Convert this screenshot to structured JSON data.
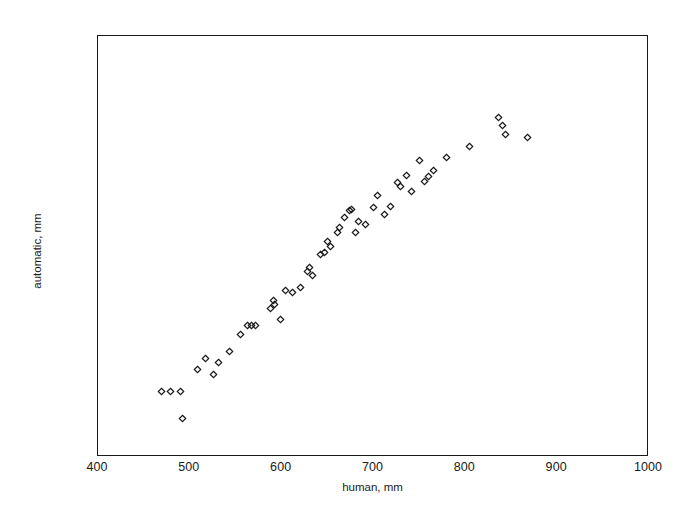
{
  "chart_data": {
    "type": "scatter",
    "title": "",
    "xlabel": "human, mm",
    "ylabel": "automatic, mm",
    "xlim": [
      400,
      1000
    ],
    "ylim": [
      400,
      1000
    ],
    "xticks": [
      400,
      500,
      600,
      700,
      800,
      900,
      1000
    ],
    "yticks": [
      400,
      500,
      600,
      700,
      800,
      900,
      1000
    ],
    "xtick_labels": [
      "400",
      "500",
      "600",
      "700",
      "800",
      "900",
      "1000"
    ],
    "ytick_labels": [
      "400",
      "500",
      "600",
      "700",
      "800",
      "900",
      "1000"
    ],
    "grid": false,
    "legend": null,
    "marker": "diamond-open",
    "marker_color": "#1a1a1a",
    "series": [
      {
        "name": "measurements",
        "points": [
          [
            469,
            494
          ],
          [
            479,
            494
          ],
          [
            490,
            493
          ],
          [
            492,
            455
          ],
          [
            508,
            524
          ],
          [
            517,
            540
          ],
          [
            526,
            518
          ],
          [
            531,
            534
          ],
          [
            543,
            551
          ],
          [
            555,
            575
          ],
          [
            563,
            588
          ],
          [
            567,
            588
          ],
          [
            572,
            588
          ],
          [
            588,
            612
          ],
          [
            591,
            623
          ],
          [
            592,
            617
          ],
          [
            599,
            596
          ],
          [
            604,
            638
          ],
          [
            612,
            635
          ],
          [
            620,
            641
          ],
          [
            628,
            664
          ],
          [
            630,
            670
          ],
          [
            634,
            659
          ],
          [
            642,
            688
          ],
          [
            647,
            692
          ],
          [
            650,
            707
          ],
          [
            653,
            700
          ],
          [
            661,
            720
          ],
          [
            663,
            727
          ],
          [
            668,
            741
          ],
          [
            674,
            752
          ],
          [
            676,
            753
          ],
          [
            680,
            720
          ],
          [
            684,
            735
          ],
          [
            691,
            731
          ],
          [
            700,
            755
          ],
          [
            704,
            773
          ],
          [
            712,
            745
          ],
          [
            719,
            757
          ],
          [
            726,
            791
          ],
          [
            729,
            785
          ],
          [
            736,
            801
          ],
          [
            741,
            779
          ],
          [
            750,
            822
          ],
          [
            755,
            793
          ],
          [
            760,
            800
          ],
          [
            765,
            809
          ],
          [
            780,
            827
          ],
          [
            804,
            842
          ],
          [
            836,
            884
          ],
          [
            840,
            872
          ],
          [
            844,
            859
          ],
          [
            868,
            855
          ]
        ]
      }
    ]
  },
  "axis": {
    "x_title": "human, mm",
    "y_title": "automatic, mm"
  }
}
